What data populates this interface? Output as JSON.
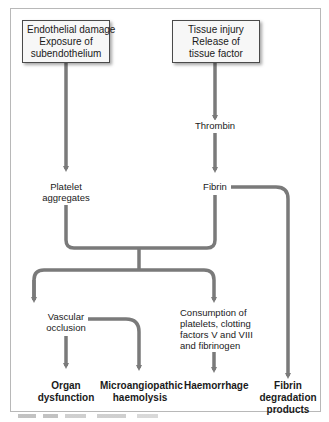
{
  "diagram": {
    "sources": [
      {
        "id": "endothelial",
        "lines": [
          "Endothelial damage",
          "Exposure of",
          "subendothelium"
        ]
      },
      {
        "id": "tissue",
        "lines": [
          "Tissue injury",
          "Release of",
          "tissue factor"
        ]
      }
    ],
    "intermediates": {
      "thrombin": "Thrombin",
      "fibrin": "Fibrin",
      "platelet": [
        "Platelet",
        "aggregates"
      ],
      "vascular": [
        "Vascular",
        "occlusion"
      ],
      "consumption": [
        "Consumption of",
        "platelets, clotting",
        "factors V and VIII",
        "and fibrinogen"
      ]
    },
    "outcomes": {
      "organ": [
        "Organ",
        "dysfunction"
      ],
      "micro": [
        "Microangiopathic",
        "haemolysis"
      ],
      "haemorrhage": [
        "Haemorrhage"
      ],
      "fdp": [
        "Fibrin",
        "degradation",
        "products"
      ]
    },
    "edges": [
      [
        "Endothelial damage",
        "Platelet aggregates"
      ],
      [
        "Tissue injury",
        "Thrombin"
      ],
      [
        "Thrombin",
        "Fibrin"
      ],
      [
        "Fibrin",
        "Fibrin degradation products"
      ],
      [
        "Platelet aggregates + Fibrin",
        "Vascular occlusion"
      ],
      [
        "Platelet aggregates + Fibrin",
        "Consumption of platelets, clotting factors V and VIII and fibrinogen"
      ],
      [
        "Vascular occlusion",
        "Organ dysfunction"
      ],
      [
        "Vascular occlusion",
        "Microangiopathic haemolysis"
      ],
      [
        "Consumption",
        "Haemorrhage"
      ]
    ],
    "colors": {
      "arrow": "#7a7a7a",
      "box_border": "#4a4a4a",
      "box_fill": "#f7f7f7",
      "frame": "#b8b8b8"
    }
  }
}
